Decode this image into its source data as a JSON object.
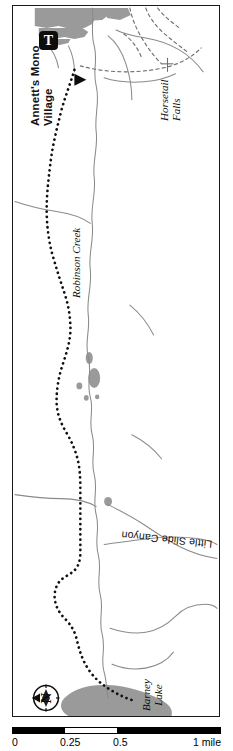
{
  "map": {
    "title": "Robinson Creek Trail Map",
    "frame": {
      "border_color": "#1a1a1a"
    },
    "colors": {
      "water_fill": "#9a9a9a",
      "landcover_fill": "#9a9a9a",
      "stream_line": "#8a8a8a",
      "trail_dotted": "#101010",
      "trail_dashed": "#6e6e6e",
      "frame": "#1a1a1a",
      "scale_dark": "#000000",
      "scale_light": "#ffffff"
    },
    "labels": {
      "village": "Annett's Mono\nVillage",
      "village_line1": "Annett's Mono",
      "village_line2": "Village",
      "horsetail_falls_line1": "Horsetail",
      "horsetail_falls_line2": "Falls",
      "robinson_creek": "Robinson Creek",
      "little_slide_canyon": "Little Slide Canyon",
      "barney_lake_line1": "Barney",
      "barney_lake_line2": "Lake"
    },
    "markers": {
      "trailhead_letter": "T",
      "trailhead_name": "trailhead",
      "compass_letter": "N",
      "compass_name": "north-arrow"
    },
    "scale": {
      "unit_label": "1 mile",
      "ticks": [
        "0",
        "0.25",
        "0.5"
      ],
      "tick_positions_pct": [
        0,
        25,
        50
      ],
      "segments": [
        {
          "fill": "dark",
          "width_pct": 25
        },
        {
          "fill": "light",
          "width_pct": 25
        },
        {
          "fill": "dark",
          "width_pct": 50
        }
      ]
    }
  }
}
